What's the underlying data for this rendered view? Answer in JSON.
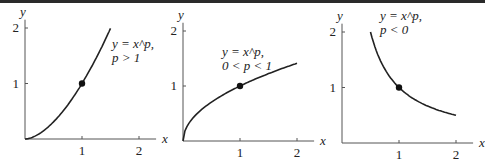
{
  "chart_data": [
    {
      "type": "line",
      "title": "",
      "label_line1": "y = x^p,",
      "label_line2": "p > 1",
      "xlabel": "x",
      "ylabel": "y",
      "xticks": [
        "1",
        "2"
      ],
      "yticks": [
        "1",
        "2"
      ],
      "xlim": [
        0,
        2
      ],
      "ylim": [
        0,
        2
      ],
      "grid": false,
      "series": [
        {
          "name": "y = x^p, p > 1",
          "x": [
            0,
            0.25,
            0.5,
            0.75,
            1,
            1.25,
            1.5
          ],
          "y": [
            0,
            0.09,
            0.31,
            0.63,
            1,
            1.43,
            1.96
          ]
        }
      ],
      "marked_point": [
        1,
        1
      ]
    },
    {
      "type": "line",
      "title": "",
      "label_line1": "y = x^p,",
      "label_line2": "0 < p < 1",
      "xlabel": "x",
      "ylabel": "y",
      "xticks": [
        "1",
        "2"
      ],
      "yticks": [
        "1",
        "2"
      ],
      "xlim": [
        0,
        2
      ],
      "ylim": [
        0,
        2
      ],
      "grid": false,
      "series": [
        {
          "name": "y = x^p, 0 < p < 1",
          "x": [
            0,
            0.25,
            0.5,
            0.75,
            1,
            1.5,
            2
          ],
          "y": [
            0,
            0.5,
            0.71,
            0.87,
            1,
            1.22,
            1.41
          ]
        }
      ],
      "marked_point": [
        1,
        1
      ]
    },
    {
      "type": "line",
      "title": "",
      "label_line1": "y = x^p,",
      "label_line2": "p < 0",
      "xlabel": "x",
      "ylabel": "y",
      "xticks": [
        "1",
        "2"
      ],
      "yticks": [
        "1",
        "2"
      ],
      "xlim": [
        0,
        2
      ],
      "ylim": [
        0,
        2
      ],
      "grid": false,
      "series": [
        {
          "name": "y = x^p, p < 0",
          "x": [
            0.5,
            0.75,
            1,
            1.25,
            1.5,
            1.75,
            2
          ],
          "y": [
            2,
            1.33,
            1,
            0.8,
            0.67,
            0.57,
            0.5
          ]
        }
      ],
      "marked_point": [
        1,
        1
      ]
    }
  ]
}
